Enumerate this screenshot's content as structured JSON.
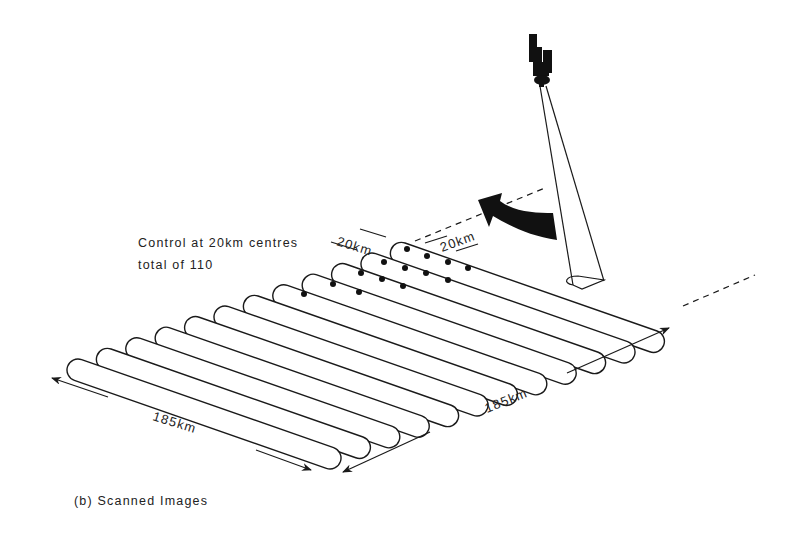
{
  "diagram": {
    "caption": "(b) Scanned Images",
    "annotation": {
      "line1": "Control at 20km centres",
      "line2": "total of 110"
    },
    "labels": {
      "spacing_left": "20km",
      "spacing_right": "20km",
      "length_left": "185km",
      "length_right": "185km"
    },
    "elements": {
      "satellite": "satellite-icon",
      "scan_direction_arrow": "curved-arrow-icon",
      "scan_footprint": "sensor-footprint",
      "strip_count": 12,
      "control_point_count_shown": 14
    },
    "colors": {
      "ink": "#1a1a1a",
      "background": "#ffffff"
    }
  }
}
